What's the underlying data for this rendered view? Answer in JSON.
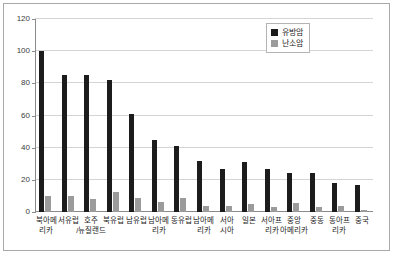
{
  "chart_data": {
    "type": "bar",
    "title": "",
    "subtitle": "",
    "xlabel": "",
    "ylabel": "",
    "ylim": [
      0,
      120
    ],
    "yticks": [
      0,
      20,
      40,
      60,
      80,
      100,
      120
    ],
    "ytick_labels": [
      "0",
      "20",
      "40",
      "60",
      "80",
      "100",
      "120"
    ],
    "grid": true,
    "legend_position": "top-right",
    "categories": [
      "북아메\n리카",
      "서유럽",
      "호주\n/뉴질랜드",
      "북유럽",
      "남유럽",
      "남아메\n리카",
      "동유럽",
      "남아메\n리카",
      "서아\n시아",
      "일본",
      "서아프\n리카",
      "중앙\n아메리카",
      "중동",
      "동아프\n리카",
      "중국"
    ],
    "series": [
      {
        "name": "유방암",
        "color": "#1c1c1c",
        "values": [
          100,
          85,
          85,
          82,
          61,
          45,
          41,
          32,
          26.5,
          31,
          26.5,
          24.5,
          24.5,
          18,
          17
        ]
      },
      {
        "name": "난소암",
        "color": "#9b9b9b",
        "values": [
          10,
          10,
          8,
          12.5,
          8.5,
          6,
          9,
          4,
          3.5,
          5,
          3,
          5.5,
          3,
          3.5,
          1.5
        ]
      }
    ]
  },
  "legend": {
    "items": [
      {
        "label": "유방암",
        "color": "#1c1c1c"
      },
      {
        "label": "난소암",
        "color": "#9b9b9b"
      }
    ]
  }
}
